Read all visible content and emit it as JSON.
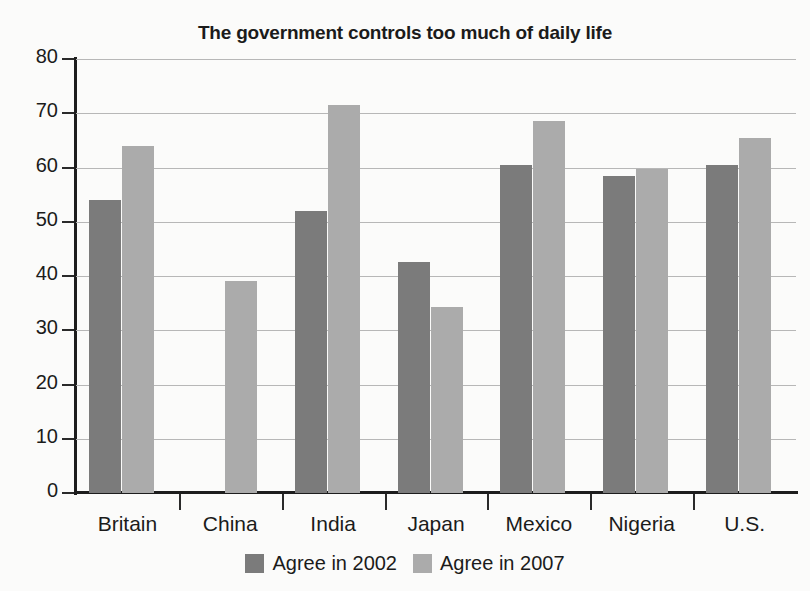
{
  "chart_data": {
    "type": "bar",
    "title": "The government controls too much of daily life",
    "xlabel": "",
    "ylabel": "",
    "ylim": [
      0,
      80
    ],
    "yticks": [
      0,
      10,
      20,
      30,
      40,
      50,
      60,
      70,
      80
    ],
    "grid": true,
    "legend_position": "bottom",
    "categories": [
      "Britain",
      "China",
      "India",
      "Japan",
      "Mexico",
      "Nigeria",
      "U.S."
    ],
    "series": [
      {
        "name": "Agree in 2002",
        "color": "#7b7b7b",
        "values": [
          54,
          null,
          52,
          42.5,
          60.5,
          58.5,
          60.5
        ]
      },
      {
        "name": "Agree in 2007",
        "color": "#ababab",
        "values": [
          64,
          39,
          71.5,
          34.3,
          68.5,
          59.8,
          65.5
        ]
      }
    ]
  },
  "legend": {
    "items": [
      {
        "label": "Agree in 2002",
        "color": "#7b7b7b"
      },
      {
        "label": "Agree in 2007",
        "color": "#ababab"
      }
    ]
  },
  "colors": {
    "series_2002": "#7b7b7b",
    "series_2007": "#ababab",
    "axis": "#1d1d1d",
    "gridline": "#b7b7b7",
    "text": "#1b1b1b",
    "background": "#fbfbfa"
  }
}
